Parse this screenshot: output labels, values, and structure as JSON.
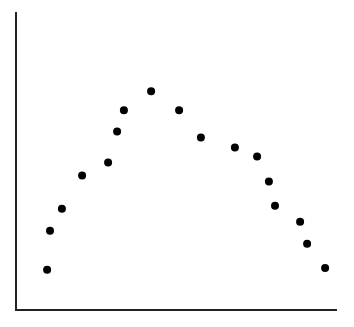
{
  "chart_data": {
    "type": "scatter",
    "title": "",
    "xlabel": "",
    "ylabel": "",
    "grid": false,
    "legend": null,
    "xlim": [
      0,
      100
    ],
    "ylim": [
      0,
      100
    ],
    "points": [
      {
        "x": 9.7,
        "y": 13.5
      },
      {
        "x": 10.6,
        "y": 26.6
      },
      {
        "x": 14.3,
        "y": 34.0
      },
      {
        "x": 20.6,
        "y": 45.1
      },
      {
        "x": 28.7,
        "y": 49.5
      },
      {
        "x": 31.5,
        "y": 59.9
      },
      {
        "x": 33.6,
        "y": 67.0
      },
      {
        "x": 42.1,
        "y": 73.4
      },
      {
        "x": 50.8,
        "y": 67.0
      },
      {
        "x": 57.6,
        "y": 57.9
      },
      {
        "x": 68.2,
        "y": 54.5
      },
      {
        "x": 75.1,
        "y": 51.5
      },
      {
        "x": 78.8,
        "y": 43.1
      },
      {
        "x": 80.7,
        "y": 35.0
      },
      {
        "x": 88.5,
        "y": 29.6
      },
      {
        "x": 90.7,
        "y": 22.2
      },
      {
        "x": 96.3,
        "y": 14.1
      }
    ],
    "style": {
      "marker_color": "#000000",
      "axis_color": "#222222"
    }
  },
  "plot_area": {
    "left": 16,
    "top": 12,
    "right": 337,
    "bottom": 310
  }
}
